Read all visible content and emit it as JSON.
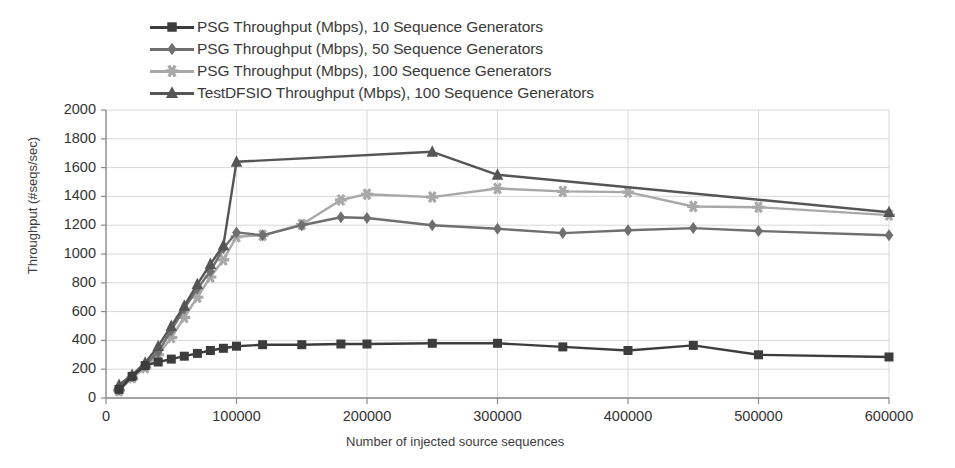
{
  "chart_data": {
    "type": "line",
    "title": "",
    "xlabel": "Number of injected source sequences",
    "ylabel": "Throughput (#seqs/sec)",
    "xlim": [
      0,
      600000
    ],
    "ylim": [
      0,
      2000
    ],
    "xticks": [
      0,
      100000,
      200000,
      300000,
      400000,
      500000,
      600000
    ],
    "xtick_labels": [
      "0",
      "100000",
      "200000",
      "300000",
      "400000",
      "500000",
      "600000"
    ],
    "yticks": [
      0,
      200,
      400,
      600,
      800,
      1000,
      1200,
      1400,
      1600,
      1800,
      2000
    ],
    "ytick_labels": [
      "0",
      "200",
      "400",
      "600",
      "800",
      "1000",
      "1200",
      "1400",
      "1600",
      "1800",
      "2000"
    ],
    "grid": true,
    "legend_position": "above-plot-left",
    "series": [
      {
        "name": "PSG Throughput (Mbps), 10 Sequence Generators",
        "marker": "square",
        "color": "#3c3c3c",
        "x": [
          10000,
          20000,
          30000,
          40000,
          50000,
          60000,
          70000,
          80000,
          90000,
          100000,
          120000,
          150000,
          180000,
          200000,
          250000,
          300000,
          350000,
          400000,
          450000,
          500000,
          600000
        ],
        "y": [
          60,
          150,
          225,
          250,
          270,
          290,
          310,
          330,
          345,
          360,
          370,
          370,
          375,
          375,
          380,
          380,
          355,
          330,
          365,
          300,
          285
        ]
      },
      {
        "name": "PSG Throughput (Mbps), 50 Sequence Generators",
        "marker": "diamond",
        "color": "#6f6f6f",
        "x": [
          10000,
          20000,
          30000,
          40000,
          50000,
          60000,
          70000,
          80000,
          90000,
          100000,
          120000,
          150000,
          180000,
          200000,
          250000,
          300000,
          350000,
          400000,
          450000,
          500000,
          600000
        ],
        "y": [
          55,
          150,
          230,
          320,
          470,
          620,
          760,
          880,
          1040,
          1150,
          1130,
          1200,
          1255,
          1250,
          1200,
          1175,
          1145,
          1165,
          1180,
          1160,
          1130
        ]
      },
      {
        "name": "PSG Throughput (Mbps), 100 Sequence Generators",
        "marker": "star",
        "color": "#a8a8a8",
        "x": [
          10000,
          20000,
          30000,
          40000,
          50000,
          60000,
          70000,
          80000,
          90000,
          100000,
          120000,
          150000,
          180000,
          200000,
          250000,
          300000,
          350000,
          400000,
          450000,
          500000,
          600000
        ],
        "y": [
          50,
          140,
          210,
          300,
          420,
          560,
          700,
          840,
          960,
          1120,
          1130,
          1205,
          1375,
          1415,
          1395,
          1455,
          1435,
          1430,
          1330,
          1325,
          1270
        ]
      },
      {
        "name": "TestDFSIO Throughput (Mbps), 100 Sequence Generators",
        "marker": "triangle",
        "color": "#555555",
        "x": [
          10000,
          20000,
          30000,
          40000,
          50000,
          60000,
          70000,
          80000,
          90000,
          100000,
          250000,
          300000,
          600000
        ],
        "y": [
          90,
          160,
          245,
          360,
          500,
          640,
          790,
          930,
          1060,
          1640,
          1710,
          1550,
          1290
        ]
      }
    ]
  },
  "legend": {
    "items": [
      {
        "label": "PSG Throughput (Mbps), 10 Sequence Generators"
      },
      {
        "label": "PSG Throughput (Mbps), 50 Sequence Generators"
      },
      {
        "label": "PSG Throughput (Mbps), 100 Sequence Generators"
      },
      {
        "label": "TestDFSIO Throughput (Mbps), 100 Sequence Generators"
      }
    ]
  }
}
